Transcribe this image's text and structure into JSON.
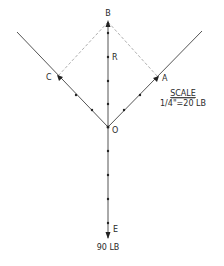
{
  "diagram": {
    "points": {
      "B": {
        "label": "B",
        "x": 108,
        "y": 22
      },
      "R": {
        "label": "R",
        "x": 108,
        "y": 57
      },
      "C": {
        "label": "C",
        "x": 58,
        "y": 76
      },
      "A": {
        "label": "A",
        "x": 158,
        "y": 77
      },
      "O": {
        "label": "O",
        "x": 108,
        "y": 127
      },
      "E": {
        "label": "E",
        "x": 108,
        "y": 237
      }
    },
    "load_label": "90 LB",
    "scale": {
      "title": "SCALE",
      "value": "1/4\"=20 LB"
    },
    "colors": {
      "line": "#555555",
      "dashed": "#9a9a9a",
      "dot": "#222222",
      "text": "#2a2a2a"
    }
  }
}
